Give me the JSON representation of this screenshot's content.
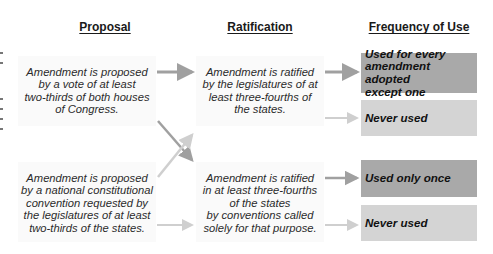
{
  "headers": {
    "proposal": "Proposal",
    "ratification": "Ratification",
    "frequency": "Frequency of Use"
  },
  "proposal": [
    {
      "text": "Amendment is proposed by a vote of at least two-thirds of both houses of Congress.",
      "lines": [
        "Amendment is proposed",
        "by a vote of at least",
        "two-thirds of both houses",
        "of Congress."
      ]
    },
    {
      "text": "Amendment is proposed by a national constitutional convention requested by the legislatures of at least two-thirds of the states.",
      "lines": [
        "Amendment is proposed",
        "by a national constitutional",
        "convention requested by",
        "the legislatures of at least",
        "two-thirds of the states."
      ]
    }
  ],
  "ratification": [
    {
      "text": "Amendment is ratified by the legislatures of at least three-fourths of the states.",
      "lines": [
        "Amendment is ratified",
        "by the legislatures of at",
        "least three-fourths of",
        "the states."
      ]
    },
    {
      "text": "Amendment is ratified in at least three-fourths of the states by conventions called solely for that purpose.",
      "lines": [
        "Amendment is ratified",
        "in at least three-fourths",
        "of the states",
        "by conventions called",
        "solely for that purpose."
      ]
    }
  ],
  "frequency": [
    {
      "lines": [
        "Used for every",
        "amendment adopted",
        "except one"
      ],
      "shade": "dark"
    },
    {
      "lines": [
        "Never used"
      ],
      "shade": "light"
    },
    {
      "lines": [
        "Used only once"
      ],
      "shade": "dark"
    },
    {
      "lines": [
        "Never used"
      ],
      "shade": "light"
    }
  ],
  "colors": {
    "dark_box": "#a9a9a9",
    "light_box": "#d4d4d4",
    "dark_arrow": "#a0a0a0",
    "light_arrow": "#cfcfcf"
  }
}
